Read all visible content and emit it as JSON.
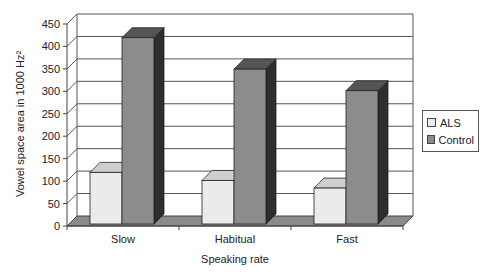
{
  "chart_data": {
    "type": "bar",
    "style": "3d-clustered-column",
    "title": "",
    "xlabel": "Speaking rate",
    "ylabel": "Vowel space area in 1000 Hz²",
    "categories": [
      "Slow",
      "Habitual",
      "Fast"
    ],
    "series": [
      {
        "name": "ALS",
        "values": [
          115,
          97,
          80
        ],
        "color": "#ebebeb"
      },
      {
        "name": "Control",
        "values": [
          415,
          345,
          297
        ],
        "color": "#8c8c8c"
      }
    ],
    "ylim": [
      0,
      450
    ],
    "yticks": [
      0,
      50,
      100,
      150,
      200,
      250,
      300,
      350,
      400,
      450
    ],
    "grid": true,
    "legend_position": "right"
  },
  "legend": {
    "items": [
      {
        "label": "ALS",
        "color": "#ebebeb"
      },
      {
        "label": "Control",
        "color": "#8c8c8c"
      }
    ]
  }
}
